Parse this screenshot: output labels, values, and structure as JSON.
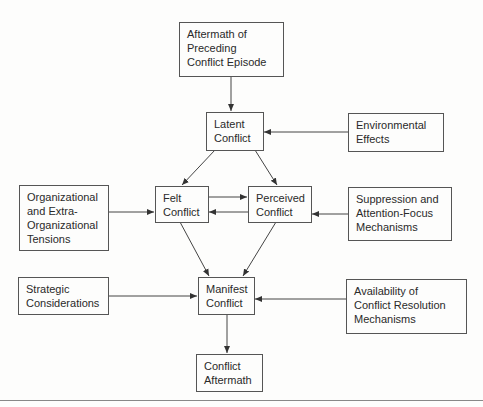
{
  "diagram": {
    "nodes": {
      "aftermath_preceding": "Aftermath of\nPreceding\nConflict Episode",
      "latent": "Latent\nConflict",
      "environmental": "Environmental\nEffects",
      "felt": "Felt\nConflict",
      "perceived": "Perceived\nConflict",
      "organizational": "Organizational\nand Extra-\nOrganizational\nTensions",
      "suppression": "Suppression and\nAttention-Focus\nMechanisms",
      "strategic": "Strategic\nConsiderations",
      "manifest": "Manifest\nConflict",
      "availability": "Availability of\nConflict Resolution\nMechanisms",
      "conflict_aftermath": "Conflict\nAftermath"
    },
    "edges": [
      [
        "aftermath_preceding",
        "latent"
      ],
      [
        "environmental",
        "latent"
      ],
      [
        "latent",
        "felt"
      ],
      [
        "latent",
        "perceived"
      ],
      [
        "felt",
        "perceived"
      ],
      [
        "perceived",
        "felt"
      ],
      [
        "organizational",
        "felt"
      ],
      [
        "suppression",
        "perceived"
      ],
      [
        "felt",
        "manifest"
      ],
      [
        "perceived",
        "manifest"
      ],
      [
        "strategic",
        "manifest"
      ],
      [
        "availability",
        "manifest"
      ],
      [
        "manifest",
        "conflict_aftermath"
      ]
    ]
  }
}
